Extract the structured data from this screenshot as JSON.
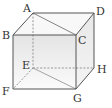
{
  "diagram": {
    "type": "cube",
    "vertices": {
      "A": {
        "label": "A",
        "x": 33,
        "y": 13,
        "lx": 23,
        "ly": 11
      },
      "B": {
        "label": "B",
        "x": 13,
        "y": 35,
        "lx": 2,
        "ly": 38
      },
      "C": {
        "label": "C",
        "x": 76,
        "y": 35,
        "lx": 78,
        "ly": 44
      },
      "D": {
        "label": "D",
        "x": 94,
        "y": 13,
        "lx": 96,
        "ly": 15
      },
      "E": {
        "label": "E",
        "x": 33,
        "y": 68,
        "lx": 22,
        "ly": 68
      },
      "F": {
        "label": "F",
        "x": 13,
        "y": 89,
        "lx": 2,
        "ly": 95
      },
      "G": {
        "label": "G",
        "x": 76,
        "y": 89,
        "lx": 73,
        "ly": 102
      },
      "H": {
        "label": "H",
        "x": 94,
        "y": 68,
        "lx": 97,
        "ly": 73
      }
    },
    "solid_edges": [
      "AB",
      "AD",
      "BC",
      "CD",
      "BF",
      "CG",
      "FG",
      "DH",
      "GH",
      "AC",
      "EG"
    ],
    "dashed_edges": [
      "AE",
      "EF",
      "EH"
    ],
    "colors": {
      "edge": "#555555",
      "hidden_edge": "#888888",
      "front_face_top": "#e6e6e6",
      "front_face_bottom": "#fbfbfb",
      "right_face": "#ececec",
      "top_face": "#f7f7f7"
    }
  }
}
